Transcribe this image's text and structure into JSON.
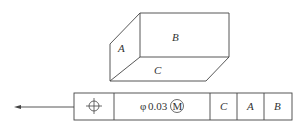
{
  "box": {
    "faces": {
      "left": "A",
      "front": "B",
      "bottom": "C"
    }
  },
  "feature_control_frame": {
    "symbol": "position",
    "tolerance_prefix": "φ",
    "tolerance_value": "0.03",
    "modifier": "M",
    "datums": [
      "C",
      "A",
      "B"
    ]
  },
  "colors": {
    "line": "#444444",
    "background": "#ffffff"
  }
}
